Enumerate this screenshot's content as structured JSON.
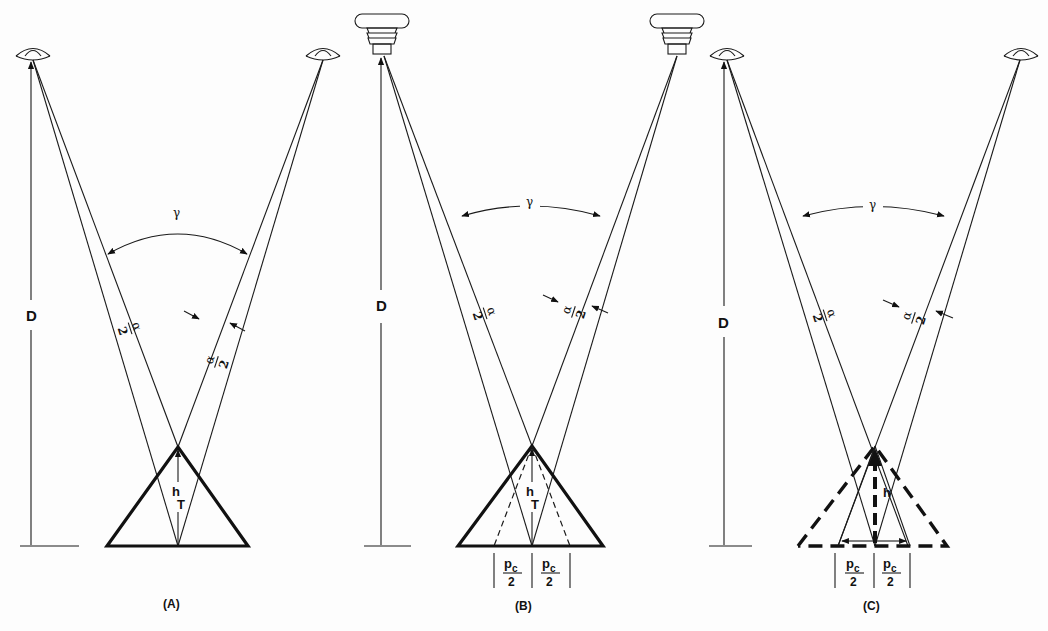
{
  "figure": {
    "panels": [
      {
        "id": "A",
        "caption": "(A)",
        "source_icon": "eye-icon",
        "distance_label": "D",
        "angle_label": "γ",
        "half_angle_label": {
          "num": "α",
          "den": "2"
        },
        "height_label": {
          "main": "h",
          "sub": "T"
        },
        "target": "solid triangle"
      },
      {
        "id": "B",
        "caption": "(B)",
        "source_icon": "projector-icon",
        "distance_label": "D",
        "angle_label": "γ",
        "half_angle_label": {
          "num": "α",
          "den": "2"
        },
        "height_label": {
          "main": "h",
          "sub": "T"
        },
        "base_labels": [
          {
            "num": "pc",
            "num_main": "p",
            "num_sub": "c",
            "den": "2"
          },
          {
            "num": "pc",
            "num_main": "p",
            "num_sub": "c",
            "den": "2"
          }
        ],
        "target": "solid triangle with dashed inner triangle"
      },
      {
        "id": "C",
        "caption": "(C)",
        "source_icon": "eye-icon",
        "distance_label": "D",
        "angle_label": "γ",
        "half_angle_label": {
          "num": "α",
          "den": "2"
        },
        "height_label": {
          "main": "h"
        },
        "base_labels": [
          {
            "num_main": "p",
            "num_sub": "c",
            "den": "2"
          },
          {
            "num_main": "p",
            "num_sub": "c",
            "den": "2"
          }
        ],
        "target": "dashed perceived triangle with solid inner triangle"
      }
    ]
  }
}
